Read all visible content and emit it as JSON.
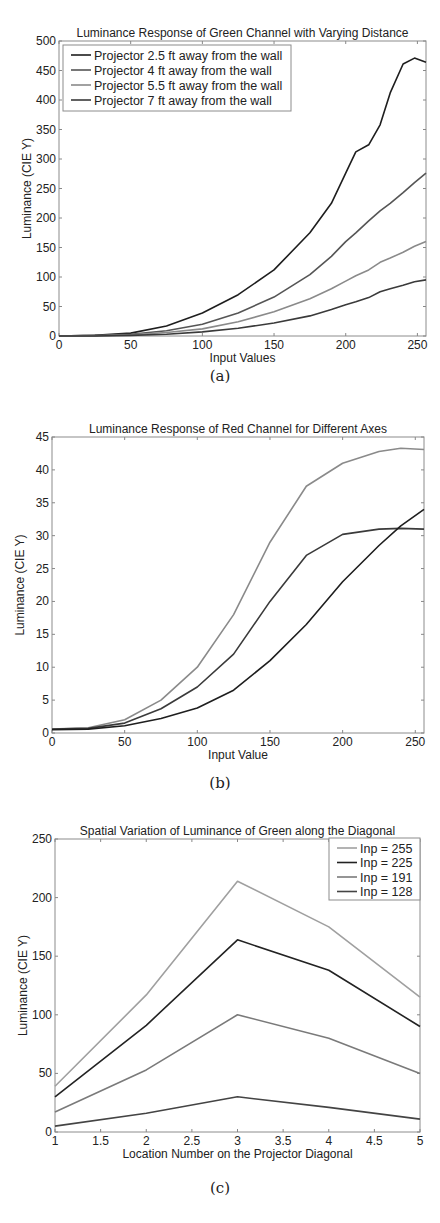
{
  "chart_data": [
    {
      "id": "a",
      "type": "line",
      "title": "Luminance Response of Green Channel with Varying Distance",
      "xlabel": "Input Values",
      "ylabel": "Luminance (CIE Y)",
      "caption": "(a)",
      "xlim": [
        0,
        256
      ],
      "ylim": [
        0,
        500
      ],
      "xticks": [
        0,
        50,
        100,
        150,
        200,
        250
      ],
      "yticks": [
        0,
        50,
        100,
        150,
        200,
        250,
        300,
        350,
        400,
        450,
        500
      ],
      "grid": false,
      "legend_position": "upper left",
      "x": [
        0,
        25,
        50,
        75,
        100,
        125,
        150,
        175,
        190,
        200,
        207,
        216,
        224,
        231,
        240,
        248,
        256
      ],
      "series": [
        {
          "name": "Projector 2.5 ft away from the wall",
          "color": "#1e1e1e",
          "values": [
            0,
            1,
            5,
            17,
            39,
            70,
            112,
            175,
            225,
            276,
            312,
            324,
            358,
            412,
            461,
            471,
            464
          ]
        },
        {
          "name": "Projector 4 ft away from the wall",
          "color": "#555555",
          "values": [
            0,
            1,
            3,
            9,
            20,
            39,
            66,
            104,
            135,
            160,
            175,
            195,
            212,
            225,
            243,
            260,
            276
          ]
        },
        {
          "name": "Projector 5.5 ft away from the wall",
          "color": "#8a8a8a",
          "values": [
            0,
            0,
            2,
            6,
            12,
            24,
            41,
            63,
            80,
            93,
            102,
            112,
            125,
            132,
            142,
            152,
            160
          ]
        },
        {
          "name": "Projector 7 ft away from the wall",
          "color": "#3a3a3a",
          "values": [
            0,
            0,
            1,
            3,
            7,
            13,
            22,
            34,
            45,
            53,
            58,
            65,
            75,
            80,
            86,
            92,
            95
          ]
        }
      ]
    },
    {
      "id": "b",
      "type": "line",
      "title": "Luminance Response of Red Channel for Different Axes",
      "xlabel": "Input Value",
      "ylabel": "Luminance (CIE Y)",
      "caption": "(b)",
      "xlim": [
        0,
        256
      ],
      "ylim": [
        0,
        45
      ],
      "xticks": [
        0,
        50,
        100,
        150,
        200,
        250
      ],
      "yticks": [
        0,
        5,
        10,
        15,
        20,
        25,
        30,
        35,
        40,
        45
      ],
      "grid": false,
      "x": [
        0,
        25,
        50,
        75,
        100,
        125,
        150,
        175,
        200,
        225,
        240,
        256
      ],
      "series": [
        {
          "name": "Axis 1",
          "color": "#8a8a8a",
          "values": [
            0.6,
            0.8,
            2.0,
            5.0,
            10.0,
            18.0,
            29.0,
            37.5,
            41.0,
            42.8,
            43.3,
            43.1
          ]
        },
        {
          "name": "Axis 2",
          "color": "#3a3a3a",
          "values": [
            0.6,
            0.7,
            1.5,
            3.7,
            7.0,
            12.0,
            20.0,
            27.0,
            30.2,
            31.0,
            31.1,
            31.0
          ]
        },
        {
          "name": "Axis 3",
          "color": "#1e1e1e",
          "values": [
            0.5,
            0.6,
            1.1,
            2.2,
            3.8,
            6.5,
            11.0,
            16.5,
            23.0,
            28.5,
            31.5,
            34.0
          ]
        }
      ]
    },
    {
      "id": "c",
      "type": "line",
      "title": "Spatial Variation of Luminance of Green along the Diagonal",
      "xlabel": "Location Number on the Projector Diagonal",
      "ylabel": "Luminance (CIE Y)",
      "caption": "(c)",
      "xlim": [
        1,
        5
      ],
      "ylim": [
        0,
        250
      ],
      "xticks": [
        1,
        1.5,
        2,
        2.5,
        3,
        3.5,
        4,
        4.5,
        5
      ],
      "yticks": [
        0,
        50,
        100,
        150,
        200,
        250
      ],
      "grid": false,
      "legend_position": "upper right",
      "x": [
        1,
        2,
        3,
        4,
        5
      ],
      "series": [
        {
          "name": "Inp = 255",
          "color": "#a0a0a0",
          "values": [
            39,
            117,
            214,
            175,
            115
          ]
        },
        {
          "name": "Inp = 225",
          "color": "#222222",
          "values": [
            30,
            91,
            164,
            138,
            90
          ]
        },
        {
          "name": "Inp = 191",
          "color": "#7a7a7a",
          "values": [
            17,
            53,
            100,
            80,
            50
          ]
        },
        {
          "name": "Inp = 128",
          "color": "#444444",
          "values": [
            5,
            16,
            30,
            21,
            11
          ]
        }
      ]
    }
  ]
}
